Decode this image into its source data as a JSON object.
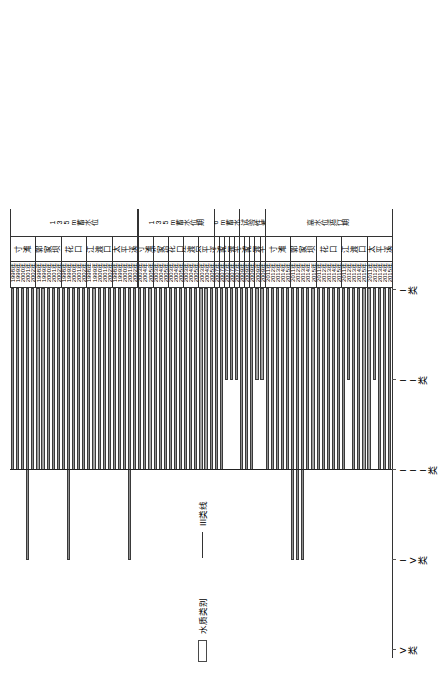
{
  "legend": {
    "items": [
      {
        "name": "water-quality-class",
        "label": "水质类别",
        "marker": "bar"
      },
      {
        "name": "class-iii-line",
        "label": "III类线",
        "marker": "line"
      }
    ]
  },
  "axis": {
    "name": "water-quality-class-axis",
    "ticks": [
      "V类",
      "IV类",
      "III类",
      "II类",
      "I类"
    ],
    "tick_values": [
      5,
      4,
      3,
      2,
      1
    ]
  },
  "chart_data": {
    "type": "bar",
    "orientation": "horizontal",
    "title": "",
    "xlabel": "",
    "ylabel": "水质类别",
    "xlim": [
      5,
      0.5
    ],
    "grid": false,
    "legend_position": "left",
    "reference_line": {
      "label": "III类线",
      "value": 3
    },
    "axis_tick_labels": [
      "V类",
      "IV类",
      "III类",
      "II类",
      "I类"
    ],
    "axis_tick_values": [
      5,
      4,
      3,
      2,
      1
    ],
    "note": "Bar length = worst water-quality class recorded; value 3 = III类, 2 = II类, 4 = IV类",
    "groups": [
      {
        "period": "135m蓄水位",
        "stations": [
          {
            "station": "寸滩",
            "categories": [
              "1998年",
              "1999年",
              "2000年",
              "2001年",
              "2002年"
            ],
            "values": [
              3,
              3,
              3,
              4,
              3
            ]
          },
          {
            "station": "郭家坝",
            "categories": [
              "1998年",
              "1999年",
              "2000年",
              "2001年",
              "2002年"
            ],
            "values": [
              3,
              3,
              3,
              3,
              3
            ]
          },
          {
            "station": "花口",
            "categories": [
              "1998年",
              "1999年",
              "2000年",
              "2001年",
              "2002年"
            ],
            "values": [
              3,
              4,
              3,
              3,
              3
            ]
          },
          {
            "station": "江渡口",
            "categories": [
              "1998年",
              "1999年",
              "2000年",
              "2001年",
              "2002年"
            ],
            "values": [
              3,
              3,
              3,
              3,
              3
            ]
          },
          {
            "station": "太平溪",
            "categories": [
              "1998年",
              "1999年",
              "2000年",
              "2001年",
              "2002年"
            ],
            "values": [
              3,
              3,
              3,
              4,
              3
            ]
          }
        ]
      },
      {
        "period": "135m蓄水位期",
        "stations": [
          {
            "station": "寸滩",
            "categories": [
              "2003年",
              "2004年",
              "2005年"
            ],
            "values": [
              3,
              3,
              3
            ]
          },
          {
            "station": "郭家坝",
            "categories": [
              "2003年",
              "2004年",
              "2005年"
            ],
            "values": [
              3,
              3,
              3
            ]
          },
          {
            "station": "花口",
            "categories": [
              "2003年",
              "2004年",
              "2005年"
            ],
            "values": [
              3,
              3,
              3
            ]
          },
          {
            "station": "江渡口",
            "categories": [
              "2003年",
              "2004年",
              "2005年"
            ],
            "values": [
              3,
              3,
              3
            ]
          },
          {
            "station": "太平溪",
            "categories": [
              "2003年",
              "2004年",
              "2005年"
            ],
            "values": [
              3,
              3,
              3
            ]
          }
        ]
      },
      {
        "period": "156m蓄水位期",
        "stations": [
          {
            "station": "寸滩",
            "categories": [
              "2007年"
            ],
            "values": [
              3
            ]
          },
          {
            "station": "郭家坝",
            "categories": [
              "2007年"
            ],
            "values": [
              3
            ]
          },
          {
            "station": "花口",
            "categories": [
              "2007年"
            ],
            "values": [
              2
            ]
          },
          {
            "station": "江渡口",
            "categories": [
              "2007年"
            ],
            "values": [
              2
            ]
          },
          {
            "station": "太平溪",
            "categories": [
              "2007年"
            ],
            "values": [
              2
            ]
          }
        ]
      },
      {
        "period": "175m试验性蓄水位期",
        "stations": [
          {
            "station": "寸滩",
            "categories": [
              "2009年"
            ],
            "values": [
              3
            ]
          },
          {
            "station": "郭家坝",
            "categories": [
              "2009年"
            ],
            "values": [
              3
            ]
          },
          {
            "station": "花口",
            "categories": [
              "2009年"
            ],
            "values": [
              3
            ]
          },
          {
            "station": "江渡口",
            "categories": [
              "2009年"
            ],
            "values": [
              2
            ]
          },
          {
            "station": "太平溪",
            "categories": [
              "2009年"
            ],
            "values": [
              2
            ]
          }
        ]
      },
      {
        "period": "高水位运行期",
        "stations": [
          {
            "station": "寸滩",
            "categories": [
              "2011年",
              "2012年",
              "2013年",
              "2014年",
              "2015年"
            ],
            "values": [
              3,
              3,
              3,
              3,
              3
            ]
          },
          {
            "station": "郭家坝",
            "categories": [
              "2011年",
              "2012年",
              "2013年",
              "2014年",
              "2015年"
            ],
            "values": [
              4,
              4,
              4,
              3,
              3
            ]
          },
          {
            "station": "花口",
            "categories": [
              "2011年",
              "2012年",
              "2013年",
              "2014年",
              "2015年"
            ],
            "values": [
              3,
              3,
              3,
              3,
              3
            ]
          },
          {
            "station": "江渡口",
            "categories": [
              "2011年",
              "2012年",
              "2013年",
              "2014年",
              "2015年"
            ],
            "values": [
              3,
              2,
              3,
              3,
              3
            ]
          },
          {
            "station": "太平溪",
            "categories": [
              "2011年",
              "2012年",
              "2013年",
              "2014年",
              "2015年"
            ],
            "values": [
              3,
              2,
              3,
              3,
              3
            ]
          }
        ]
      }
    ]
  }
}
